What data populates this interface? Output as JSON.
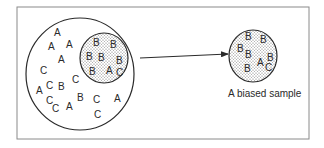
{
  "figure": {
    "caption": "A biased sample",
    "colors": {
      "stroke": "#2a2a2a",
      "frame": "#8a8a8a",
      "dots": "#6a6a6a"
    }
  },
  "population": {
    "letters": [
      {
        "t": "A",
        "x": 54,
        "y": 36
      },
      {
        "t": "A",
        "x": 48,
        "y": 50
      },
      {
        "t": "A",
        "x": 66,
        "y": 48
      },
      {
        "t": "A",
        "x": 58,
        "y": 63
      },
      {
        "t": "C",
        "x": 40,
        "y": 74
      },
      {
        "t": "C",
        "x": 72,
        "y": 83
      },
      {
        "t": "A",
        "x": 36,
        "y": 94
      },
      {
        "t": "C",
        "x": 46,
        "y": 89
      },
      {
        "t": "B",
        "x": 58,
        "y": 90
      },
      {
        "t": "C",
        "x": 46,
        "y": 104
      },
      {
        "t": "C",
        "x": 52,
        "y": 112
      },
      {
        "t": "A",
        "x": 66,
        "y": 110
      },
      {
        "t": "B",
        "x": 77,
        "y": 101
      },
      {
        "t": "C",
        "x": 93,
        "y": 103
      },
      {
        "t": "A",
        "x": 114,
        "y": 102
      },
      {
        "t": "C",
        "x": 94,
        "y": 118
      }
    ]
  },
  "subset": {
    "letters": [
      {
        "t": "B",
        "x": 93,
        "y": 46
      },
      {
        "t": "B",
        "x": 110,
        "y": 48
      },
      {
        "t": "B",
        "x": 86,
        "y": 60
      },
      {
        "t": "B",
        "x": 98,
        "y": 61
      },
      {
        "t": "B",
        "x": 116,
        "y": 64
      },
      {
        "t": "B",
        "x": 89,
        "y": 75
      },
      {
        "t": "A",
        "x": 106,
        "y": 74
      },
      {
        "t": "C",
        "x": 116,
        "y": 76
      }
    ]
  },
  "sample": {
    "letters": [
      {
        "t": "B",
        "x": 245,
        "y": 40
      },
      {
        "t": "B",
        "x": 260,
        "y": 43
      },
      {
        "t": "B",
        "x": 237,
        "y": 52
      },
      {
        "t": "B",
        "x": 245,
        "y": 58
      },
      {
        "t": "A",
        "x": 257,
        "y": 66
      },
      {
        "t": "B",
        "x": 267,
        "y": 61
      },
      {
        "t": "C",
        "x": 265,
        "y": 71
      },
      {
        "t": "B",
        "x": 244,
        "y": 72
      }
    ]
  }
}
